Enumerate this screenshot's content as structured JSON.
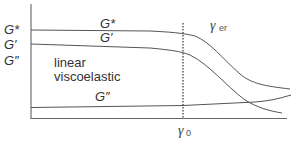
{
  "diagram": {
    "y_axis_labels": [
      "G*",
      "G′",
      "G″"
    ],
    "curve_labels": {
      "g_star": "G*",
      "g_prime": "G′",
      "g_double_prime": "G″"
    },
    "region_label_line1": "linear",
    "region_label_line2": "viscoelastic",
    "gamma_er": {
      "symbol": "γ",
      "subscript": "er"
    },
    "gamma_0": {
      "symbol": "γ",
      "subscript": "0"
    },
    "colors": {
      "axis": "#555555",
      "curve": "#555555",
      "dashed": "#333333",
      "text": "#333333"
    }
  }
}
